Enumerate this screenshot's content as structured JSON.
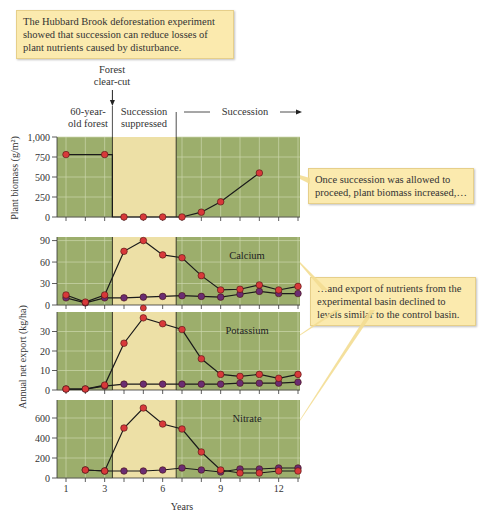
{
  "title_callout": "The Hubbard Brook deforestation experiment showed that succession can reduce losses of plant nutrients caused by disturbance.",
  "callout_biomass": "Once succession was allowed to proceed, plant biomass increased,…",
  "callout_nutrients": "…and export of nutrients from the experimental basin declined to levels similar to the control basin.",
  "annotations": {
    "clearcut": "Forest clear-cut",
    "old_forest": "60-year-old forest",
    "suppressed": "Succession suppressed",
    "succession": "Succession"
  },
  "colors": {
    "green_bg": "#9cae6c",
    "tan_bg": "#ede0a6",
    "experimental": "#d8393a",
    "control": "#6a2d72",
    "grid": "#cdd7ad"
  },
  "chart_data": [
    {
      "type": "line",
      "title": "Plant biomass",
      "xlabel": "Years",
      "ylabel": "Plant biomass (g/m²)",
      "yticks": [
        0,
        250,
        500,
        750,
        1000
      ],
      "ylim": [
        0,
        1000
      ],
      "series": [
        {
          "name": "Experimental basin",
          "x": [
            1,
            3,
            4,
            5,
            6,
            7,
            8,
            9,
            11
          ],
          "values": [
            780,
            780,
            0,
            0,
            0,
            0,
            60,
            190,
            550
          ]
        }
      ]
    },
    {
      "type": "line",
      "title": "Calcium",
      "ylabel": "Annual net export (kg/ha)",
      "yticks": [
        0,
        30,
        60,
        90
      ],
      "ylim": [
        0,
        95
      ],
      "series": [
        {
          "name": "Experimental basin",
          "x": [
            1,
            2,
            3,
            4,
            5,
            6,
            7,
            8,
            9,
            10,
            11,
            12,
            13
          ],
          "values": [
            14,
            4,
            14,
            75,
            90,
            70,
            66,
            41,
            21,
            22,
            28,
            21,
            26
          ]
        },
        {
          "name": "Control basin",
          "x": [
            1,
            2,
            3,
            4,
            5,
            6,
            7,
            8,
            9,
            10,
            11,
            12,
            13
          ],
          "values": [
            10,
            3,
            10,
            10,
            11,
            12,
            13,
            12,
            11,
            15,
            19,
            16,
            16
          ]
        }
      ]
    },
    {
      "type": "line",
      "title": "Potassium",
      "yticks": [
        0,
        10,
        20,
        30
      ],
      "ylim": [
        0,
        40
      ],
      "series": [
        {
          "name": "Experimental basin",
          "x": [
            1,
            2,
            3,
            4,
            5,
            6,
            7,
            8,
            9,
            10,
            11,
            12,
            13
          ],
          "values": [
            0.5,
            0.5,
            2.5,
            24,
            37,
            34,
            31,
            16,
            8,
            7,
            8,
            6,
            8
          ]
        },
        {
          "name": "Control basin",
          "x": [
            1,
            2,
            3,
            4,
            5,
            6,
            7,
            8,
            9,
            10,
            11,
            12,
            13
          ],
          "values": [
            0.5,
            0.5,
            2,
            3,
            3,
            3,
            3,
            3,
            3,
            3.5,
            3.5,
            3.5,
            4
          ]
        }
      ]
    },
    {
      "type": "line",
      "title": "Nitrate",
      "xlabel": "Years",
      "xticks": [
        1,
        3,
        6,
        9,
        12
      ],
      "yticks": [
        0,
        200,
        400,
        600
      ],
      "ylim": [
        0,
        780
      ],
      "series": [
        {
          "name": "Experimental basin",
          "x": [
            2,
            3,
            4,
            5,
            6,
            7,
            8,
            9,
            10,
            11,
            12,
            13
          ],
          "values": [
            80,
            70,
            500,
            700,
            540,
            490,
            260,
            80,
            50,
            50,
            70,
            70
          ]
        },
        {
          "name": "Control basin",
          "x": [
            2,
            3,
            4,
            5,
            6,
            7,
            8,
            9,
            10,
            11,
            12,
            13
          ],
          "values": [
            80,
            70,
            70,
            70,
            80,
            100,
            80,
            60,
            90,
            90,
            100,
            100
          ]
        }
      ]
    }
  ]
}
